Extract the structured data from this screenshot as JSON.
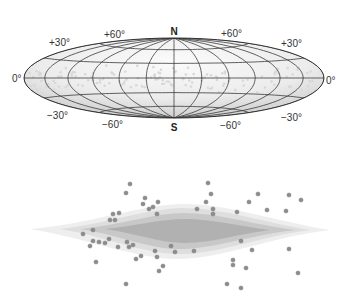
{
  "sky_map": {
    "projection": "all-sky (Hammer–Aitoff style) ellipse",
    "pole_labels": {
      "north": "N",
      "south": "S"
    },
    "latitude_labels": {
      "equator_left": "0°",
      "equator_right": "0°",
      "plus30_left": "+30°",
      "plus30_right": "+30°",
      "plus60_left": "+60°",
      "plus60_right": "+60°",
      "minus30_left": "−30°",
      "minus30_right": "−30°",
      "minus60_left": "−60°",
      "minus60_right": "−60°"
    },
    "grid": {
      "latitudes_deg": [
        -60,
        -30,
        0,
        30,
        60
      ],
      "longitudes_deg": [
        -180,
        -150,
        -120,
        -90,
        -60,
        -30,
        0,
        30,
        60,
        90,
        120,
        150,
        180
      ]
    },
    "colors": {
      "outline": "#333333",
      "fill_light": "#f4f4f4",
      "fill_dark": "#cfcfcf",
      "dots": "#d8d8d8"
    }
  },
  "edge_on_galaxy": {
    "description": "edge-on disk view with scattered objects",
    "colors": {
      "disk_outer": "#e6e6e6",
      "disk_mid": "#cccccc",
      "disk_inner": "#a9a9a9",
      "dot": "#8c8c8c",
      "dot_stroke": "#777777"
    }
  }
}
